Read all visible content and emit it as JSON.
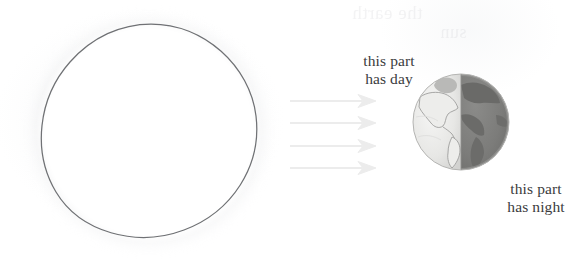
{
  "diagram": {
    "medium": "pencil drawing on scanned paper",
    "sun": {
      "name": "sun",
      "shape": "hand-drawn circle",
      "outline_color": "#6f7174",
      "fill_color": "#fdfdfd",
      "center": [
        148,
        131
      ],
      "radius": 105
    },
    "sun_rays": {
      "name": "sunlight arrows",
      "count": 4,
      "direction": "left-to-right",
      "color": "#ececec"
    },
    "earth": {
      "name": "earth",
      "center": [
        461,
        122
      ],
      "radius": 49,
      "day_side": "left",
      "night_side": "right",
      "day_color": "#e6e6e4",
      "night_color": "#7c7c7a",
      "terminator_x": 461
    },
    "labels": {
      "day": "this part\nhas day",
      "night": "this part\nhas night"
    },
    "bleed_through": [
      "the earth",
      "sun",
      "night"
    ]
  }
}
